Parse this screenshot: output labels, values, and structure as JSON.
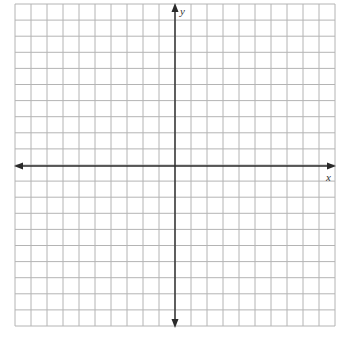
{
  "diagram": {
    "type": "coordinate-plane",
    "x_range": [
      -10,
      10
    ],
    "y_range": [
      -10,
      10
    ],
    "grid_cells_x": 20,
    "grid_cells_y": 20,
    "axis_labels": {
      "x": "x",
      "y": "y"
    },
    "tick_labels": "none",
    "arrows": [
      "left",
      "right",
      "up",
      "down"
    ]
  },
  "colors": {
    "background": "#ffffff",
    "grid": "#b4b4b4",
    "axis": "#2a2a2a",
    "label": "#333333"
  }
}
